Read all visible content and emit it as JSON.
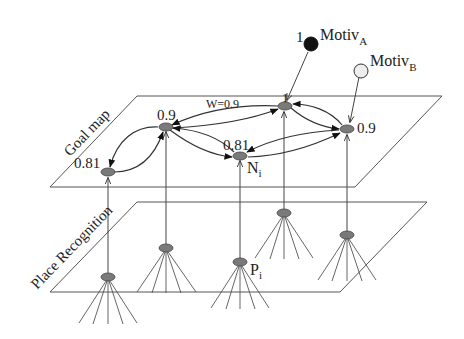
{
  "diagram": {
    "layers": {
      "goal_map": {
        "label": "Goal map"
      },
      "place_recognition": {
        "label": "Place Recognition"
      }
    },
    "motivations": [
      {
        "id": "A",
        "label": "Motiv",
        "subscript": "A",
        "activation": "1",
        "fill": "#111111"
      },
      {
        "id": "B",
        "label": "Motiv",
        "subscript": "B",
        "fill": "#eeeeee"
      }
    ],
    "goal_nodes": [
      {
        "id": "g1",
        "value": "0.81"
      },
      {
        "id": "g2",
        "value": "0.9"
      },
      {
        "id": "g3",
        "value": "0.81",
        "name": "N",
        "subscript": "i"
      },
      {
        "id": "g4",
        "value": "1"
      },
      {
        "id": "g5",
        "value": "0.9"
      }
    ],
    "edge_weight_label": "W=0.9",
    "place_nodes": [
      {
        "id": "p1"
      },
      {
        "id": "p2"
      },
      {
        "id": "p3",
        "name": "P",
        "subscript": "i"
      },
      {
        "id": "p4"
      },
      {
        "id": "p5"
      }
    ],
    "edges": [
      [
        "g2",
        "g1"
      ],
      [
        "g1",
        "g2"
      ],
      [
        "g4",
        "g2"
      ],
      [
        "g2",
        "g4"
      ],
      [
        "g2",
        "g3"
      ],
      [
        "g3",
        "g2"
      ],
      [
        "g4",
        "g5"
      ],
      [
        "g5",
        "g4"
      ],
      [
        "g5",
        "g3"
      ],
      [
        "g3",
        "g5"
      ]
    ],
    "colors": {
      "node_fill": "#7a7a7a",
      "line": "#333333",
      "motiv_a": "#111111",
      "motiv_b": "#eeeeee"
    }
  }
}
